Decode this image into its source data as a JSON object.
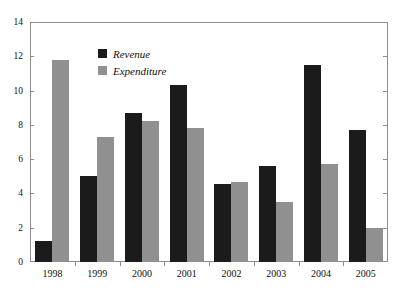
{
  "chart_data": {
    "type": "bar",
    "title": "",
    "subtitle": "",
    "xlabel": "",
    "ylabel": "",
    "categories": [
      "1998",
      "1999",
      "2000",
      "2001",
      "2002",
      "2003",
      "2004",
      "2005"
    ],
    "series": [
      {
        "name": "Revenue",
        "color": "#1b1b1b",
        "values": [
          1.2,
          5.0,
          8.7,
          10.3,
          4.55,
          5.6,
          11.5,
          7.7
        ]
      },
      {
        "name": "Expenditure",
        "color": "#909090",
        "values": [
          11.8,
          7.3,
          8.2,
          7.8,
          4.65,
          3.5,
          5.7,
          2.0
        ]
      }
    ],
    "ylim": [
      0,
      14
    ],
    "ytick_values": [
      0,
      2,
      4,
      6,
      8,
      10,
      12,
      14
    ],
    "ytick_labels": [
      "0",
      "2",
      "4",
      "6",
      "8",
      "10",
      "12",
      "14"
    ],
    "xtick_labels": [
      "1998",
      "1999",
      "2000",
      "2001",
      "2002",
      "2003",
      "2004",
      "2005"
    ],
    "grid": false,
    "legend_position": "upper-center",
    "legend_entries": [
      {
        "label": "Revenue",
        "color": "#1b1b1b"
      },
      {
        "label": "Expenditure",
        "color": "#909090"
      }
    ],
    "frame_color": "#8c8c8c",
    "background_color": "#ffffff"
  }
}
